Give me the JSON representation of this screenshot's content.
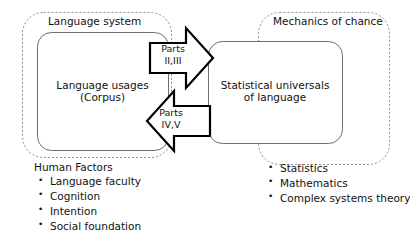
{
  "diagram": {
    "left_region": {
      "title": "Language  system",
      "box_label_line1": "Language usages",
      "box_label_line2": "(Corpus)",
      "list_heading": "Human Factors",
      "list_items": [
        "Language faculty",
        "Cognition",
        "Intention",
        "Social foundation"
      ]
    },
    "right_region": {
      "title": "Mechanics of chance",
      "box_label_line1": "Statistical universals",
      "box_label_line2": "of language",
      "list_items": [
        "Statistics",
        "Mathematics",
        "Complex systems theory"
      ]
    },
    "arrows": {
      "top": {
        "direction": "right",
        "label_line1": "Parts",
        "label_line2": "II,III"
      },
      "bottom": {
        "direction": "left",
        "label_line1": "Parts",
        "label_line2": "IV,V"
      }
    },
    "colors": {
      "background": "#ffffff",
      "dashed_stroke": "#8c8c8c",
      "solid_stroke": "#6e6e6e",
      "arrow_stroke": "#000000",
      "text": "#111111"
    }
  }
}
